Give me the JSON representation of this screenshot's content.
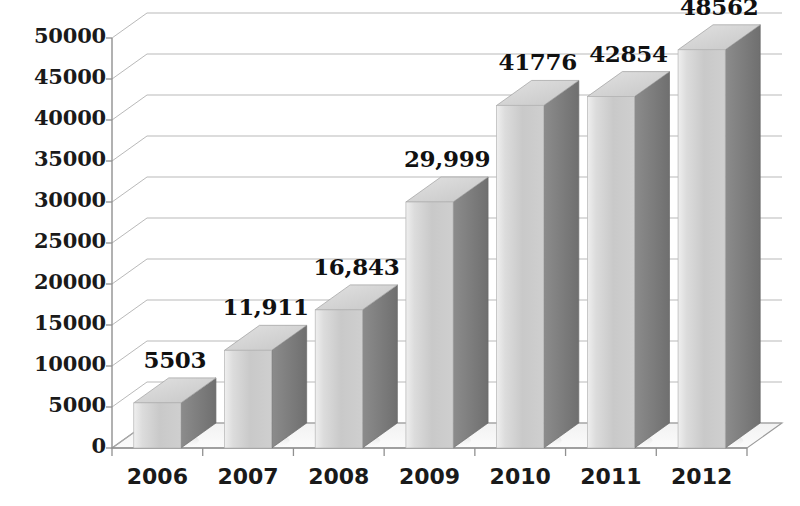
{
  "chart_data": {
    "type": "bar",
    "title": "",
    "subtitle": "",
    "xlabel": "",
    "ylabel": "",
    "categories": [
      "2006",
      "2007",
      "2008",
      "2009",
      "2010",
      "2011",
      "2012"
    ],
    "values": [
      5503,
      11911,
      16843,
      29999,
      41776,
      42854,
      48562
    ],
    "value_labels": [
      "5503",
      "11,911",
      "16,843",
      "29,999",
      "41776",
      "42854",
      "48562"
    ],
    "series": [
      {
        "name": "",
        "values": [
          5503,
          11911,
          16843,
          29999,
          41776,
          42854,
          48562
        ]
      }
    ],
    "ylim": [
      0,
      50000
    ],
    "ytick_step": 5000,
    "ytick_labels": [
      "0",
      "5000",
      "10000",
      "15000",
      "20000",
      "25000",
      "30000",
      "35000",
      "40000",
      "45000",
      "50000"
    ],
    "ytick_values": [
      0,
      5000,
      10000,
      15000,
      20000,
      25000,
      30000,
      35000,
      40000,
      45000,
      50000
    ],
    "grid": true,
    "grid_axis": "y",
    "legend": false,
    "legend_position": "none",
    "three_d": true,
    "colors": {
      "bar_front_light": "#e6e6e6",
      "bar_front_mid": "#c4c4c4",
      "bar_front_dark": "#d0d0d0",
      "bar_side": "#7d7d7d",
      "bar_top": "#d9d9d9",
      "grid_line": "#a8a8a8",
      "axis_line": "#808080",
      "floor": "#ffffff",
      "text": "#1a1a1a",
      "background": "#ffffff"
    }
  }
}
